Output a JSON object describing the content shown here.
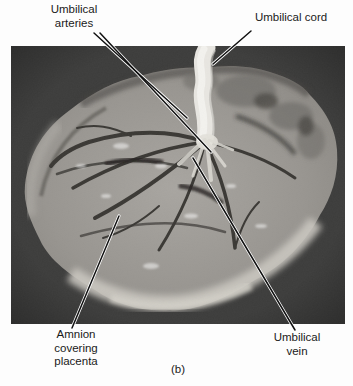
{
  "figure": {
    "caption": "(b)",
    "photo": {
      "alt": "Photograph of the fetal surface of a placenta with attached umbilical cord on a dark background"
    },
    "labels": {
      "umbilical_arteries": "Umbilical arteries",
      "umbilical_cord": "Umbilical cord",
      "amnion": "Amnion covering placenta",
      "umbilical_vein": "Umbilical vein"
    },
    "colors": {
      "page_bg": "#fdfdfd",
      "text": "#1a1a1a",
      "photo_bg": "#3a3a3a",
      "tissue": "#9b9893",
      "tissue_light": "#c9c6bf",
      "cord": "#e8e6e1",
      "vessel": "#3a3834",
      "leader_line": "#111111"
    }
  }
}
